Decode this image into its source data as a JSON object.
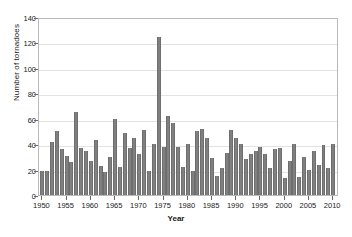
{
  "chart_data": {
    "type": "bar",
    "title": "",
    "xlabel": "Year",
    "ylabel": "Number of tornadoes",
    "xlim": [
      1949.3,
      2011.2
    ],
    "ylim": [
      0,
      140
    ],
    "ytick_step": 20,
    "xtick_step": 5,
    "grid": true,
    "legend": null,
    "bar_color": "#808080",
    "axis_color": "#b9b9b9",
    "grid_color": "#e3e3e3",
    "yticks": [
      0,
      20,
      40,
      60,
      80,
      100,
      120,
      140
    ],
    "xticks": [
      1950,
      1955,
      1960,
      1965,
      1970,
      1975,
      1980,
      1985,
      1990,
      1995,
      2000,
      2005,
      2010
    ],
    "categories": [
      1950,
      1951,
      1952,
      1953,
      1954,
      1955,
      1956,
      1957,
      1958,
      1959,
      1960,
      1961,
      1962,
      1963,
      1964,
      1965,
      1966,
      1967,
      1968,
      1969,
      1970,
      1971,
      1972,
      1973,
      1974,
      1975,
      1976,
      1977,
      1978,
      1979,
      1980,
      1981,
      1982,
      1983,
      1984,
      1985,
      1986,
      1987,
      1988,
      1989,
      1990,
      1991,
      1992,
      1993,
      1994,
      1995,
      1996,
      1997,
      1998,
      1999,
      2000,
      2001,
      2002,
      2003,
      2004,
      2005,
      2006,
      2007,
      2008,
      2009,
      2010
    ],
    "values": [
      19,
      19,
      42,
      50,
      36,
      31,
      26,
      65,
      37,
      35,
      27,
      43,
      23,
      18,
      30,
      60,
      22,
      49,
      37,
      45,
      32,
      51,
      19,
      40,
      124,
      38,
      62,
      57,
      38,
      22,
      40,
      19,
      50,
      52,
      45,
      29,
      15,
      21,
      33,
      51,
      45,
      40,
      28,
      32,
      35,
      38,
      32,
      21,
      36,
      37,
      13,
      27,
      40,
      14,
      30,
      20,
      35,
      24,
      39,
      21,
      40
    ]
  }
}
